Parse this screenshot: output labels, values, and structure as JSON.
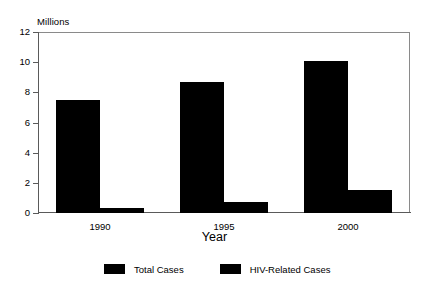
{
  "chart_data": {
    "type": "bar",
    "title": "",
    "subtitle": "",
    "unit_label": "Millions",
    "xlabel": "Year",
    "ylabel": "",
    "categories": [
      "1990",
      "1995",
      "2000"
    ],
    "series": [
      {
        "name": "Total Cases",
        "values": [
          7.5,
          8.7,
          10.1
        ],
        "color": "#000000"
      },
      {
        "name": "HIV-Related Cases",
        "values": [
          0.35,
          0.75,
          1.5
        ],
        "color": "#000000"
      }
    ],
    "ylim": [
      0,
      12
    ],
    "yticks": [
      0,
      2,
      4,
      6,
      8,
      10,
      12
    ],
    "ytick_labels": [
      "0",
      "2",
      "4",
      "6",
      "8",
      "10",
      "12"
    ],
    "grid": false,
    "legend_position": "bottom",
    "bar_style": "grouped-adjacent"
  },
  "legend": {
    "items": [
      {
        "label": "Total Cases"
      },
      {
        "label": "HIV-Related Cases"
      }
    ]
  },
  "axes": {
    "y_unit": "Millions",
    "x_title": "Year"
  }
}
